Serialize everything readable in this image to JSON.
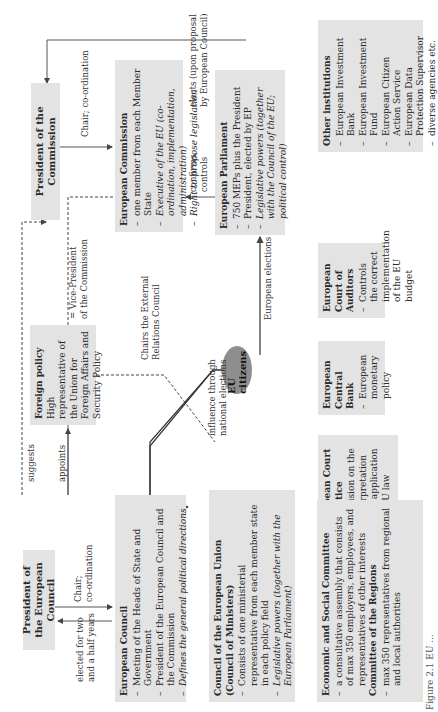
{
  "diagram": {
    "president_commission": {
      "title": "President of the Commission"
    },
    "european_commission": {
      "title": "European Commission",
      "items": [
        {
          "text": "one member from each Member State",
          "italic": false
        },
        {
          "text": "Executive of the EU (co-ordination, implementation, administration)",
          "italic": true
        },
        {
          "text": "Right to propose legislation",
          "italic": true
        }
      ]
    },
    "european_parliament": {
      "title": "European Parliament",
      "items": [
        {
          "text": "750 MEPs plus the President",
          "italic": false
        },
        {
          "text": "President, elected by EP",
          "italic": false
        },
        {
          "text": "Legislative powers (together with the Council of the EU; political control)",
          "italic": true
        }
      ]
    },
    "other_institutions": {
      "title": "Other institutions",
      "items": [
        "European Investment Bank",
        "European Investment Fund",
        "European Citizen Action Service",
        "European Data Protection Supervisor",
        "diverse agencies etc."
      ]
    },
    "foreign_policy": {
      "title": "Foreign policy",
      "text": "High representative of the Union for Foreign Affairs and Security Policy"
    },
    "eu_citizens": {
      "label": "EU citizens"
    },
    "court_of_auditors": {
      "title": "European Court of Auditors",
      "items": [
        "Controls the correct implementation of the EU budget"
      ]
    },
    "central_bank": {
      "title": "European Central Bank",
      "items": [
        "European monetary policy"
      ]
    },
    "court_of_justice": {
      "title": "European Court of Justice",
      "items": [
        "Decision on the interpretation and application of EU law"
      ]
    },
    "president_european_council": {
      "title": "President of the European Council"
    },
    "european_council": {
      "title": "European Council",
      "items": [
        {
          "text": "Meeting of the Heads of State and Government",
          "italic": false
        },
        {
          "text": "President of the European Council and the Commission",
          "italic": false
        },
        {
          "text": "Defines the general political directions",
          "italic": true
        }
      ]
    },
    "council_eu": {
      "title": "Council of the European Union (Council of Ministers)",
      "items": [
        {
          "text": "Consists of one ministerial representative from each member state in each policy field",
          "italic": false
        },
        {
          "text": "Legislative powers (together with the European Parliament)",
          "italic": true
        }
      ]
    },
    "committees": {
      "esc_title": "Economic and Social Committee",
      "esc_item": "a consultative assembly that consists of max 350 employers, employees, and representatives of other interests",
      "cor_title": "Committee of the Regions",
      "cor_item": "max 350 representatives from regional and local authorities"
    },
    "edge_labels": {
      "chair_coordination_commission": "Chair; co-ordination",
      "elects_upon_proposal": [
        "elects (upon proposal",
        "by European Council)"
      ],
      "confirms_controls": [
        "confirms,",
        "controls"
      ],
      "vice_president": [
        "= Vice-President",
        "of the Commission"
      ],
      "chairs_external": [
        "Chairs the External",
        "Relations Council"
      ],
      "influence_national": [
        "influence through",
        "national elections"
      ],
      "european_elections": "European elections",
      "suggests": "suggests",
      "appoints": "appoints",
      "chair_coordination_council": [
        "Chair;",
        "co-ordination"
      ],
      "elected_two_half": [
        "elected for two",
        "and a half years"
      ]
    },
    "caption": "Figure 2.1 EU ..."
  }
}
